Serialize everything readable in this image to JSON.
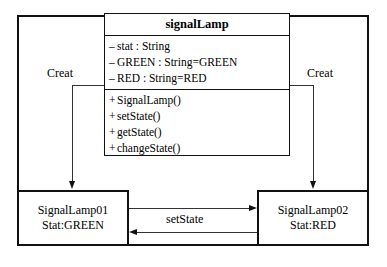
{
  "diagram": {
    "type": "uml-collaboration-diagram",
    "class_box": {
      "name": "signalLamp",
      "attributes": [
        {
          "visibility": "–",
          "text": "stat : String"
        },
        {
          "visibility": "–",
          "text": "GREEN : String=GREEN"
        },
        {
          "visibility": "–",
          "text": "RED : String=RED"
        }
      ],
      "methods": [
        {
          "visibility": "+",
          "text": "SignalLamp()"
        },
        {
          "visibility": "+",
          "text": "setState()"
        },
        {
          "visibility": "+",
          "text": "getState()"
        },
        {
          "visibility": "+",
          "text": "changeState()"
        }
      ]
    },
    "instances": [
      {
        "id": "signal-lamp-01",
        "name": "SignalLamp01",
        "state": "Stat:GREEN"
      },
      {
        "id": "signal-lamp-02",
        "name": "SignalLamp02",
        "state": "Stat:RED"
      }
    ],
    "edges": [
      {
        "id": "creat-left",
        "label": "Creat",
        "direction": "down"
      },
      {
        "id": "creat-right",
        "label": "Creat",
        "direction": "down"
      },
      {
        "id": "setstate",
        "label": "setState",
        "direction": "right"
      },
      {
        "id": "return",
        "label": "",
        "direction": "left"
      }
    ],
    "colors": {
      "background": "#ffffff",
      "stroke": "#111111",
      "connector": "#333333",
      "text": "#000000"
    }
  }
}
